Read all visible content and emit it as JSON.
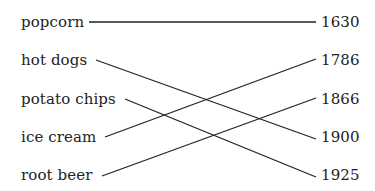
{
  "diagram": {
    "type": "matching",
    "left_items": [
      {
        "label": "popcorn",
        "y": 22
      },
      {
        "label": "hot dogs",
        "y": 60
      },
      {
        "label": "potato chips",
        "y": 99
      },
      {
        "label": "ice cream",
        "y": 137
      },
      {
        "label": "root beer",
        "y": 175
      }
    ],
    "right_items": [
      {
        "label": "1630",
        "y": 22
      },
      {
        "label": "1786",
        "y": 60
      },
      {
        "label": "1866",
        "y": 99
      },
      {
        "label": "1900",
        "y": 137
      },
      {
        "label": "1925",
        "y": 175
      }
    ],
    "connections": [
      {
        "from": "popcorn",
        "to": "1630"
      },
      {
        "from": "hot dogs",
        "to": "1900"
      },
      {
        "from": "potato chips",
        "to": "1925"
      },
      {
        "from": "ice cream",
        "to": "1786"
      },
      {
        "from": "root beer",
        "to": "1866"
      }
    ],
    "line_color": "#222222"
  }
}
